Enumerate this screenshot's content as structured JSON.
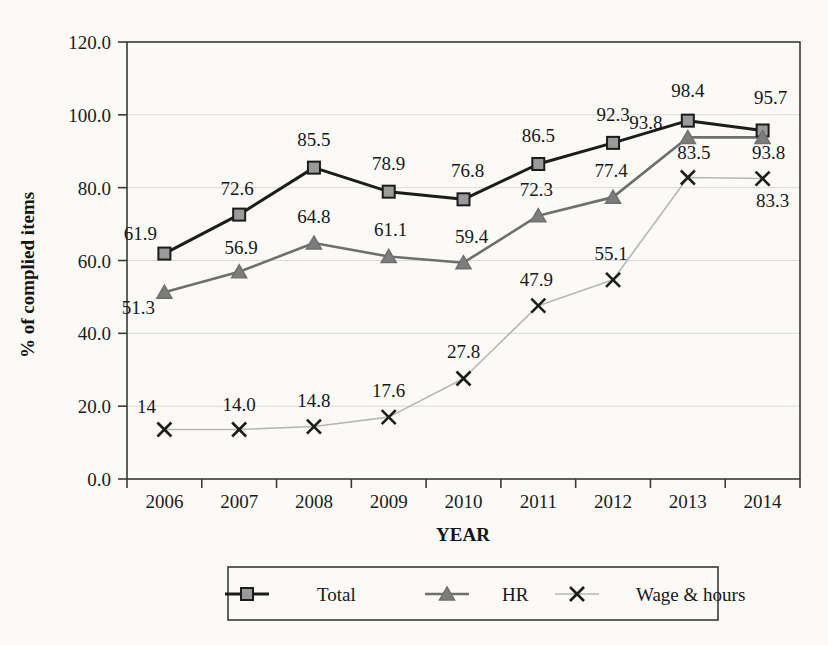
{
  "chart_data": {
    "type": "line",
    "title": "",
    "xlabel": "YEAR",
    "ylabel": "% of complied items",
    "categories": [
      "2006",
      "2007",
      "2008",
      "2009",
      "2010",
      "2011",
      "2012",
      "2013",
      "2014"
    ],
    "ylim": [
      0,
      120
    ],
    "ytick_labels": [
      "0.0",
      "20.0",
      "40.0",
      "60.0",
      "80.0",
      "100.0",
      "120.0"
    ],
    "ytick_values": [
      0,
      20,
      40,
      60,
      80,
      100,
      120
    ],
    "grid": true,
    "legend_position": "bottom",
    "series": [
      {
        "name": "Total",
        "marker": "square",
        "color": "#1c1c1c",
        "marker_fill": "#9a9a9a",
        "values": [
          61.9,
          72.6,
          85.5,
          78.9,
          76.8,
          86.5,
          92.3,
          98.4,
          95.7
        ],
        "labels": [
          "61.9",
          "72.6",
          "85.5",
          "78.9",
          "76.8",
          "86.5",
          "92.3",
          "98.4",
          "95.7"
        ]
      },
      {
        "name": "HR",
        "marker": "triangle",
        "color": "#6f6f6f",
        "marker_fill": "#7d7d7d",
        "values": [
          51.3,
          56.9,
          64.8,
          61.1,
          59.4,
          72.3,
          77.4,
          93.8,
          93.8
        ],
        "labels": [
          "51.3",
          "56.9",
          "64.8",
          "61.1",
          "59.4",
          "72.3",
          "77.4",
          "93.8",
          "93.8"
        ]
      },
      {
        "name": "Wage & hours",
        "marker": "cross",
        "color": "#b7b7b7",
        "marker_fill": "#1c1c1c",
        "values": [
          13.6,
          13.6,
          14.4,
          17.0,
          27.6,
          47.6,
          54.7,
          82.8,
          82.5
        ],
        "labels": [
          "14",
          "14.0",
          "14.8",
          "17.6",
          "27.8",
          "47.9",
          "55.1",
          "83.5",
          "83.3"
        ]
      }
    ]
  },
  "legend": {
    "items": [
      {
        "label": "Total"
      },
      {
        "label": "HR"
      },
      {
        "label": "Wage & hours"
      }
    ]
  }
}
